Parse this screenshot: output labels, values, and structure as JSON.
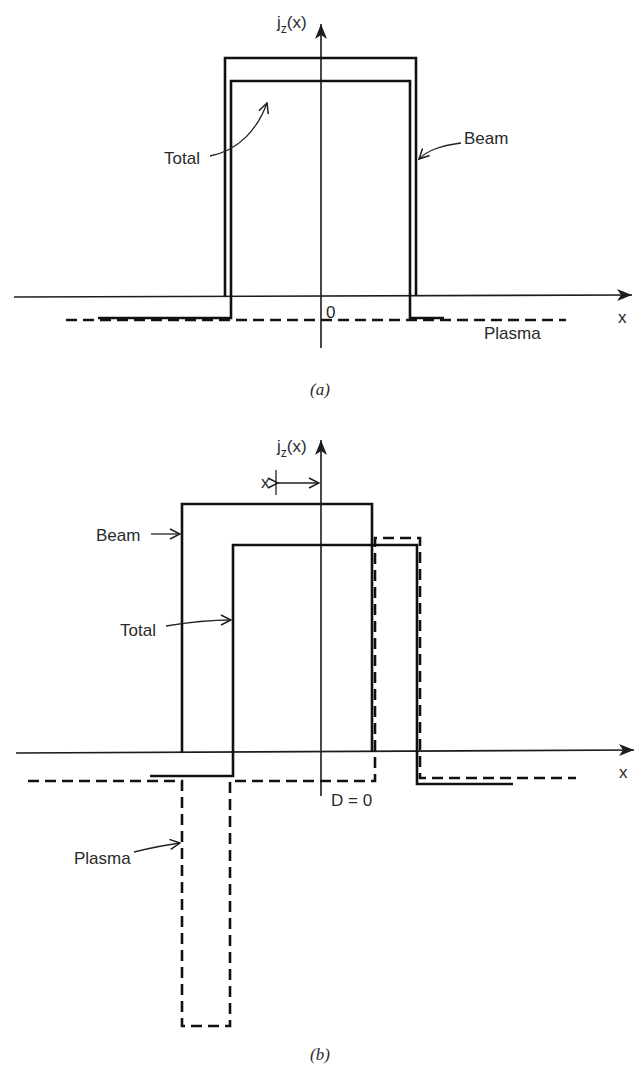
{
  "figure": {
    "panel_a": {
      "caption": "(a)",
      "y_axis_label": "j",
      "y_axis_subscript": "z",
      "y_axis_arg": "(x)",
      "x_axis_label": "x",
      "origin_label": "0",
      "labels": {
        "total": "Total",
        "beam": "Beam",
        "plasma": "Plasma"
      }
    },
    "panel_b": {
      "caption": "(b)",
      "y_axis_label": "j",
      "y_axis_subscript": "z",
      "y_axis_arg": "(x)",
      "x_axis_label": "x",
      "origin_label": "D = 0",
      "displacement_label": "x",
      "labels": {
        "beam": "Beam",
        "total": "Total",
        "plasma": "Plasma"
      }
    }
  },
  "colors": {
    "line": "#111111",
    "text": "#2a2a2a",
    "background": "#ffffff"
  }
}
